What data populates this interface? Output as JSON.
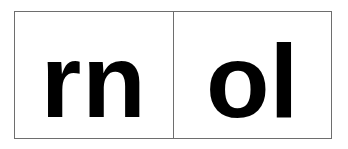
{
  "figure": {
    "background_color": "#ffffff",
    "border_color": "#6e6e6e",
    "glyph_color": "#000000",
    "cells": [
      {
        "id": "left",
        "text": "rn",
        "characters": [
          "r",
          "n"
        ],
        "description": "lowercase r followed by lowercase n"
      },
      {
        "id": "right",
        "text": "ol",
        "characters": [
          "o",
          "l"
        ],
        "description": "lowercase o followed by lowercase l"
      }
    ]
  }
}
